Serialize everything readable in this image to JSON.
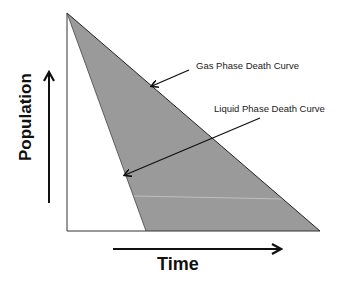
{
  "diagram": {
    "type": "death-curve-comparison",
    "colors": {
      "background": "#ffffff",
      "fill_region": "#9a9a9a",
      "line": "#222222",
      "highlight_streak": "#c8c8c8"
    },
    "axes": {
      "y_label": "Population",
      "x_label": "Time"
    },
    "curves": [
      {
        "name": "Gas Phase Death Curve",
        "label": "Gas Phase Death Curve",
        "start": [
          67,
          13
        ],
        "end": [
          320,
          231
        ]
      },
      {
        "name": "Liquid Phase Death Curve",
        "label": "Liquid Phase Death Curve",
        "start": [
          67,
          13
        ],
        "end": [
          146,
          231
        ]
      }
    ],
    "annotations": [
      {
        "text": "Gas Phase Death Curve",
        "arrow_from": [
          189,
          70
        ],
        "arrow_to": [
          152,
          86
        ]
      },
      {
        "text": "Liquid Phase Death Curve",
        "arrow_from": [
          260,
          118
        ],
        "arrow_to": [
          125,
          175
        ]
      }
    ]
  }
}
